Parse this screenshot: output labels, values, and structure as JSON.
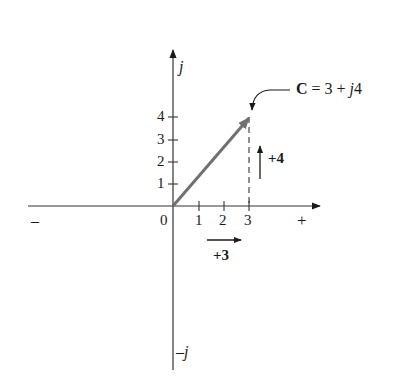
{
  "diagram": {
    "type": "complex-plane-phasor",
    "axes": {
      "real_negative_label": "–",
      "real_positive_label": "+",
      "imag_positive_label": "j",
      "imag_negative_label": "–j",
      "origin_label": "0"
    },
    "real_ticks": [
      {
        "value": 1,
        "label": "1"
      },
      {
        "value": 2,
        "label": "2"
      },
      {
        "value": 3,
        "label": "3"
      }
    ],
    "imag_ticks": [
      {
        "value": 1,
        "label": "1"
      },
      {
        "value": 2,
        "label": "2"
      },
      {
        "value": 3,
        "label": "3"
      },
      {
        "value": 4,
        "label": "4"
      }
    ],
    "vector": {
      "name": "C",
      "real": 3,
      "imag": 4,
      "color": "#707070"
    },
    "annotation": {
      "bold_part": "C",
      "equals_part": " = 3 + ",
      "j_part": "j",
      "tail_part": "4"
    },
    "components": {
      "real_label": "+3",
      "imag_label": "+4"
    }
  }
}
